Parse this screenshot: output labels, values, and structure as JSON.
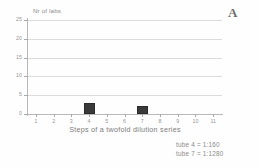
{
  "panel": {
    "label": "A"
  },
  "chart_data": {
    "type": "bar",
    "title": "",
    "xlabel": "Steps of a twofold dilution series",
    "ylabel": "Nr of labs",
    "categories": [
      "1",
      "2",
      "3",
      "4",
      "5",
      "6",
      "7",
      "8",
      "9",
      "10",
      "11"
    ],
    "values": [
      0,
      0,
      0,
      3,
      0,
      0,
      2,
      0,
      0,
      0,
      0
    ],
    "xlim": [
      0.5,
      11.5
    ],
    "ylim": [
      0,
      25
    ],
    "yticks": [
      0,
      5,
      10,
      15,
      20,
      25
    ],
    "ytick_labels": [
      "0",
      "5",
      "10",
      "15",
      "20",
      "25"
    ],
    "grid": "horizontal",
    "legend": "none",
    "bar_color": "#3a3a3a",
    "grid_color": "#dcdcdc",
    "axis_color": "#b9b9b9",
    "annotations": [
      "tube 4 = 1:160",
      "tube 7 = 1:1280"
    ]
  }
}
